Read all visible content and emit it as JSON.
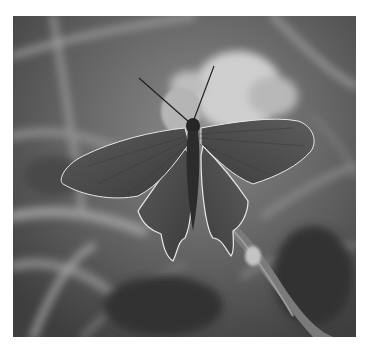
{
  "image": {
    "subject": "swallowtail butterfly with open wings perched on a leaf",
    "style": "black-and-white photograph",
    "background": "blurred grass stems and a pale flower",
    "border_color": "#ffffff",
    "tones": {
      "dark": "#2a2a2a",
      "mid": "#6a6a6a",
      "light": "#c8c8c8",
      "wing": "#4a4a4a",
      "wing_edge": "#e8e8e8"
    }
  }
}
